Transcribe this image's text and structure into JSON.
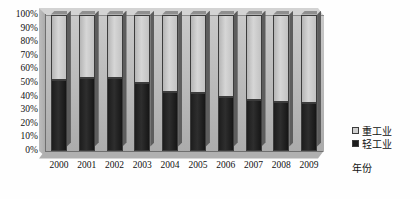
{
  "chart_data": {
    "type": "bar",
    "subtype": "100% stacked column (3D)",
    "title": "",
    "xlabel": "年份",
    "ylabel": "",
    "categories": [
      "2000",
      "2001",
      "2002",
      "2003",
      "2004",
      "2005",
      "2006",
      "2007",
      "2008",
      "2009"
    ],
    "series": [
      {
        "name": "重工业",
        "color": "#cfcfcf",
        "values": [
          48,
          47,
          47,
          50,
          57,
          58,
          61,
          63,
          64,
          65
        ]
      },
      {
        "name": "轻工业",
        "color": "#1c1c1c",
        "values": [
          52,
          53,
          53,
          50,
          43,
          42,
          39,
          37,
          36,
          35
        ]
      }
    ],
    "ylim": [
      0,
      100
    ],
    "ytick_labels": [
      "100%",
      "90%",
      "80%",
      "70%",
      "60%",
      "50%",
      "40%",
      "30%",
      "20%",
      "10%",
      "0%"
    ],
    "ytick_values": [
      100,
      90,
      80,
      70,
      60,
      50,
      40,
      30,
      20,
      10,
      0
    ],
    "grid": false,
    "legend_position": "right"
  },
  "legend": {
    "items": [
      {
        "label": "重工业",
        "swatch": "sw-heavy"
      },
      {
        "label": "轻工业",
        "swatch": "sw-light"
      }
    ]
  },
  "axis": {
    "x_title": "年份"
  }
}
